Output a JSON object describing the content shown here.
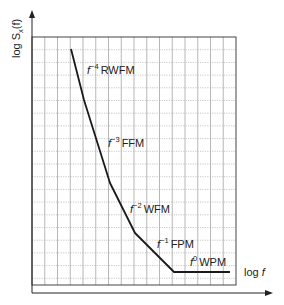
{
  "chart_data": {
    "type": "line",
    "title": "",
    "xlabel": "log f",
    "ylabel": "log S_x(f)",
    "grid": true,
    "legend": null,
    "axis_ticks": "none",
    "segments": [
      {
        "slope_label": "f^-4",
        "name": "RWFM",
        "power": -4
      },
      {
        "slope_label": "f^-3",
        "name": "FFM",
        "power": -3
      },
      {
        "slope_label": "f^-2",
        "name": "WFM",
        "power": -2
      },
      {
        "slope_label": "f^-1",
        "name": "FPM",
        "power": -1
      },
      {
        "slope_label": "f^0",
        "name": "WPM",
        "power": 0
      }
    ],
    "polyline_px": [
      [
        71,
        49
      ],
      [
        84,
        100
      ],
      [
        110,
        183
      ],
      [
        135,
        233
      ],
      [
        174,
        272
      ],
      [
        230,
        272
      ]
    ]
  },
  "axes": {
    "y_label_prefix": "log S",
    "y_label_sub": "x",
    "y_label_suffix": "(f)",
    "x_label_prefix": "log ",
    "x_label_var": "f"
  },
  "labels": [
    {
      "base": "f",
      "exp": "−4",
      "name": "RWFM"
    },
    {
      "base": "f",
      "exp": "−3",
      "name": "FFM"
    },
    {
      "base": "f",
      "exp": "−2",
      "name": "WFM"
    },
    {
      "base": "f",
      "exp": "−1",
      "name": "FPM"
    },
    {
      "base": "f",
      "exp": "0",
      "name": "WPM"
    }
  ],
  "colors": {
    "curve": "#1a1a1a",
    "grid_solid": "#9a9a9a",
    "grid_dotted": "#b0b0b0",
    "frame": "#333333",
    "text": "#222222"
  }
}
